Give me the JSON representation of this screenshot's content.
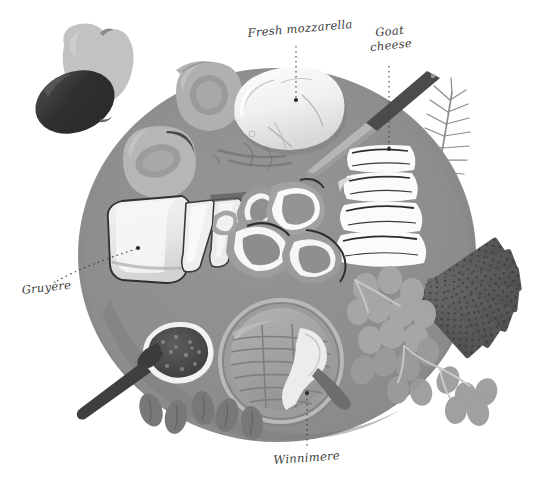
{
  "illustration": {
    "title": "Cheese board illustration",
    "style": "grayscale watercolor",
    "background_color": "#ffffff",
    "plate_color": "#8e8e8e",
    "plate_shadow_color": "#7c7c7c"
  },
  "labels": [
    {
      "id": "mozzarella",
      "text": "Fresh mozzarella",
      "leader": "dotted-vertical",
      "points_to": "mozzarella-ball"
    },
    {
      "id": "goat",
      "line1": "Goat",
      "line2": "cheese",
      "text": "Goat cheese",
      "leader": "dotted-vertical",
      "points_to": "goat-cheese-slices"
    },
    {
      "id": "gruyere",
      "text": "Gruyère",
      "leader": "dotted-curve",
      "points_to": "gruyere-wedges"
    },
    {
      "id": "winnimere",
      "text": "Winnimere",
      "leader": "dotted-vertical",
      "points_to": "winnimere-wheel"
    }
  ],
  "items": [
    {
      "name": "apple",
      "tone": "#bdbdbd"
    },
    {
      "name": "plum",
      "tone": "#3f3f3f"
    },
    {
      "name": "peach-half-top",
      "tone": "#a9a9a9"
    },
    {
      "name": "peach-half-lower",
      "tone": "#b4b4b4"
    },
    {
      "name": "mozzarella-ball",
      "tone": "#f2f2f2"
    },
    {
      "name": "cheese-knife",
      "tone": "#5a5a5a"
    },
    {
      "name": "goat-cheese-slices",
      "tone": "#fafafa"
    },
    {
      "name": "rosemary-sprig",
      "tone": "#9a9a9a"
    },
    {
      "name": "crackers",
      "tone": "#5e5e5e"
    },
    {
      "name": "gruyere-wedges",
      "tone": "#ededed"
    },
    {
      "name": "prosciutto-slices",
      "tone": "#a0a0a0"
    },
    {
      "name": "grapes",
      "tone": "#9d9d9d"
    },
    {
      "name": "winnimere-wheel",
      "tone": "#a2a2a2"
    },
    {
      "name": "jam-bowl",
      "tone": "#4d4d4d"
    },
    {
      "name": "jam-spoon",
      "tone": "#4a4a4a"
    },
    {
      "name": "almonds",
      "tone": "#7a7a7a"
    }
  ]
}
